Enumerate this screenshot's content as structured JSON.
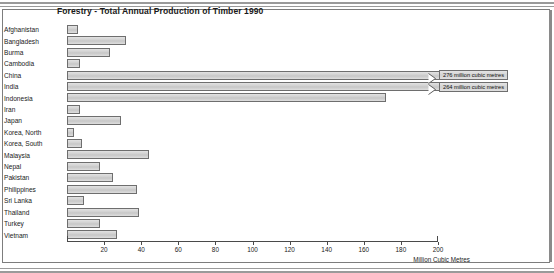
{
  "title": "Forestry - Total Annual Production of Timber 1990",
  "xaxis_title": "Million Cubic Metres",
  "callouts": [
    {
      "country": "China",
      "label": "276 million cubic metres"
    },
    {
      "country": "India",
      "label": "264 million cubic metres"
    }
  ],
  "chart_data": {
    "type": "bar",
    "orientation": "horizontal",
    "title": "Forestry - Total Annual Production of Timber 1990",
    "xlabel": "Million Cubic Metres",
    "ylabel": "",
    "xlim": [
      0,
      200
    ],
    "xticks": [
      20,
      40,
      60,
      80,
      100,
      120,
      140,
      160,
      180,
      200
    ],
    "xticklabels": [
      "20",
      "40",
      "60",
      "80",
      "100",
      "120",
      "140",
      "160",
      "180",
      "200"
    ],
    "grid": false,
    "legend": null,
    "units": "million cubic metres",
    "categories": [
      "Afghanistan",
      "Bangladesh",
      "Burma",
      "Cambodia",
      "China",
      "India",
      "Indonesia",
      "Iran",
      "Japan",
      "Korea, North",
      "Korea, South",
      "Malaysia",
      "Nepal",
      "Pakistan",
      "Philippines",
      "Sri Lanka",
      "Thailand",
      "Turkey",
      "Vietnam"
    ],
    "values": [
      6,
      32,
      23,
      7,
      276,
      264,
      172,
      7,
      29,
      4,
      8,
      44,
      18,
      25,
      38,
      9,
      39,
      18,
      27
    ],
    "overflow": [
      false,
      false,
      false,
      false,
      true,
      true,
      false,
      false,
      false,
      false,
      false,
      false,
      false,
      false,
      false,
      false,
      false,
      false,
      false
    ],
    "annotations": [
      "276 million cubic metres",
      "264 million cubic metres"
    ]
  }
}
